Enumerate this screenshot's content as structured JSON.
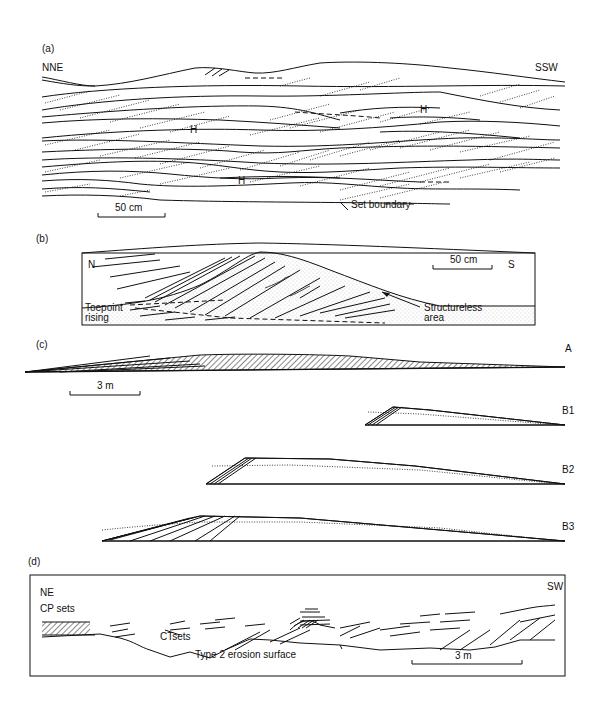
{
  "panels": {
    "a": {
      "label": "(a)",
      "orientation_left": "NNE",
      "orientation_right": "SSW",
      "markers": [
        "H",
        "H",
        "H"
      ],
      "annotation": "Set boundary",
      "scale_bar": "50 cm"
    },
    "b": {
      "label": "(b)",
      "orientation_left": "N",
      "orientation_right": "S",
      "scale_bar": "50 cm",
      "annotation_left": "Toepoint rising",
      "annotation_left_line1": "Toepoint",
      "annotation_left_line2": "rising",
      "annotation_right_line1": "Structureless",
      "annotation_right_line2": "area"
    },
    "c": {
      "label": "(c)",
      "scale_bar": "3 m",
      "profiles": [
        "A",
        "B1",
        "B2",
        "B3"
      ]
    },
    "d": {
      "label": "(d)",
      "orientation_left": "NE",
      "orientation_right": "SW",
      "annotation_cp": "CP sets",
      "annotation_ct": "CTsets",
      "annotation_erosion": "Type 2 erosion surface",
      "scale_bar": "3 m"
    }
  }
}
